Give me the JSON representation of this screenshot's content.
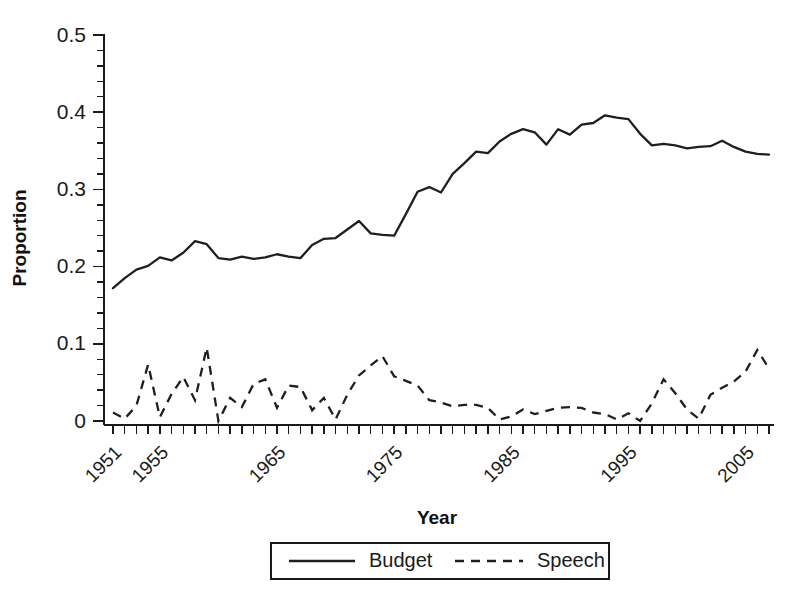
{
  "chart_data": {
    "type": "line",
    "title": "",
    "xlabel": "Year",
    "ylabel": "Proportion",
    "xlim": [
      1951,
      2007
    ],
    "ylim": [
      0,
      0.5
    ],
    "grid": false,
    "legend_position": "bottom-outside",
    "y_ticks_major": [
      0,
      0.1,
      0.2,
      0.3,
      0.4,
      0.5
    ],
    "y_tick_labels": [
      "0",
      "0.1",
      "0.2",
      "0.3",
      "0.4",
      "0.5"
    ],
    "y_ticks_minor_step": 0.02,
    "x_tick_labels": [
      "1951",
      "1955",
      "1965",
      "1975",
      "1985",
      "1995",
      "2005"
    ],
    "x_tick_label_years": [
      1951,
      1955,
      1965,
      1975,
      1985,
      1995,
      2005
    ],
    "x_tick_label_rotation": 45,
    "x": [
      1951,
      1952,
      1953,
      1954,
      1955,
      1956,
      1957,
      1958,
      1959,
      1960,
      1961,
      1962,
      1963,
      1964,
      1965,
      1966,
      1967,
      1968,
      1969,
      1970,
      1971,
      1972,
      1973,
      1974,
      1975,
      1976,
      1977,
      1978,
      1979,
      1980,
      1981,
      1982,
      1983,
      1984,
      1985,
      1986,
      1987,
      1988,
      1989,
      1990,
      1991,
      1992,
      1993,
      1994,
      1995,
      1996,
      1997,
      1998,
      1999,
      2000,
      2001,
      2002,
      2003,
      2004,
      2005,
      2006,
      2007
    ],
    "series": [
      {
        "name": "Budget",
        "style": "solid",
        "color": "#1f1f1f",
        "values": [
          0.172,
          0.185,
          0.196,
          0.201,
          0.212,
          0.208,
          0.218,
          0.233,
          0.229,
          0.211,
          0.209,
          0.213,
          0.21,
          0.212,
          0.216,
          0.213,
          0.211,
          0.228,
          0.236,
          0.237,
          0.248,
          0.259,
          0.243,
          0.241,
          0.24,
          0.268,
          0.297,
          0.303,
          0.296,
          0.32,
          0.334,
          0.349,
          0.347,
          0.362,
          0.372,
          0.378,
          0.374,
          0.358,
          0.378,
          0.371,
          0.384,
          0.386,
          0.396,
          0.393,
          0.391,
          0.372,
          0.357,
          0.359,
          0.357,
          0.353,
          0.355,
          0.356,
          0.363,
          0.355,
          0.349,
          0.346,
          0.345
        ]
      },
      {
        "name": "Speech",
        "style": "dashed",
        "color": "#1f1f1f",
        "values": [
          0.011,
          0.003,
          0.02,
          0.073,
          0.005,
          0.035,
          0.057,
          0.027,
          0.095,
          0.0,
          0.03,
          0.018,
          0.048,
          0.054,
          0.017,
          0.046,
          0.044,
          0.014,
          0.03,
          0.002,
          0.034,
          0.059,
          0.072,
          0.084,
          0.058,
          0.052,
          0.046,
          0.027,
          0.024,
          0.019,
          0.021,
          0.021,
          0.017,
          0.002,
          0.006,
          0.015,
          0.009,
          0.013,
          0.017,
          0.018,
          0.017,
          0.011,
          0.009,
          0.002,
          0.01,
          0.0,
          0.023,
          0.054,
          0.036,
          0.015,
          0.003,
          0.034,
          0.043,
          0.051,
          0.064,
          0.092,
          0.068
        ]
      }
    ],
    "legend": [
      {
        "label": "Budget",
        "style": "solid"
      },
      {
        "label": "Speech",
        "style": "dashed"
      }
    ]
  }
}
